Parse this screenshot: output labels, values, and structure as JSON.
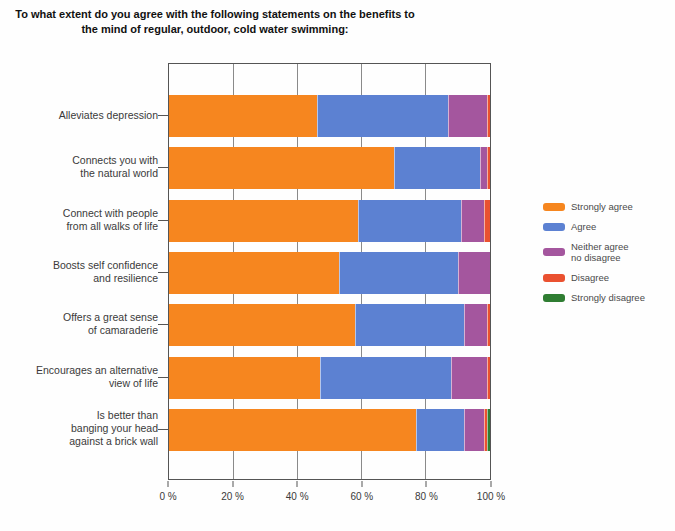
{
  "title": "To what extent do you agree with the following statements on the benefits to\nthe mind of regular, outdoor, cold water swimming:",
  "chart_data": {
    "type": "bar",
    "orientation": "horizontal",
    "stacked": true,
    "title": "To what extent do you agree with the following statements on the benefits to the mind of regular, outdoor, cold water swimming:",
    "xlabel": "",
    "ylabel": "",
    "xlim": [
      0,
      100
    ],
    "grid": true,
    "legend_position": "right",
    "x_tick_values": [
      0,
      20,
      40,
      60,
      80,
      100
    ],
    "x_tick_labels": [
      "0 %",
      "20 %",
      "40 %",
      "60 %",
      "80 %",
      "100 %"
    ],
    "categories": [
      "Alleviates depression",
      "Connects you with\nthe natural world",
      "Connect with people\nfrom all walks of life",
      "Boosts self confidence\nand resilience",
      "Offers a great sense\nof camaraderie",
      "Encourages an alternative\nview of life",
      "Is better than\nbanging your head\nagainst a brick wall"
    ],
    "series": [
      {
        "name": "Strongly agree",
        "color": "#f6861f",
        "values": [
          46,
          70,
          59,
          53,
          58,
          47,
          77
        ]
      },
      {
        "name": "Agree",
        "color": "#5c81d2",
        "values": [
          41,
          27,
          32,
          37,
          34,
          41,
          15
        ]
      },
      {
        "name": "Neither agree\nno disagree",
        "color": "#a4569e",
        "values": [
          12,
          2,
          7,
          10,
          7,
          11,
          6
        ]
      },
      {
        "name": "Disagree",
        "color": "#ea5130",
        "values": [
          1,
          1,
          2,
          0,
          1,
          1,
          1
        ]
      },
      {
        "name": "Strongly disagree",
        "color": "#2f7d32",
        "values": [
          0,
          0,
          0,
          0,
          0,
          0,
          1
        ]
      }
    ]
  }
}
